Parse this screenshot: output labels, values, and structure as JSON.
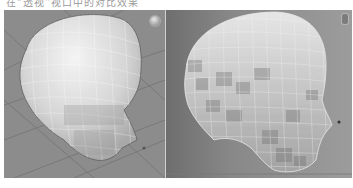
{
  "caption": {
    "text": "在“透视”视口中的对比效果"
  },
  "viewports": [
    {
      "id": "left",
      "view": "perspective",
      "content": "head-mesh",
      "background": "#8c8c8c",
      "mesh_color": "#d8d8d8",
      "has_grid": true,
      "has_nav_gizmo": true
    },
    {
      "id": "right",
      "view": "perspective",
      "content": "head-mesh-refined",
      "background": "#888888",
      "mesh_color": "#c8c8c8",
      "has_grid": false,
      "has_nav_gizmo": true
    }
  ]
}
